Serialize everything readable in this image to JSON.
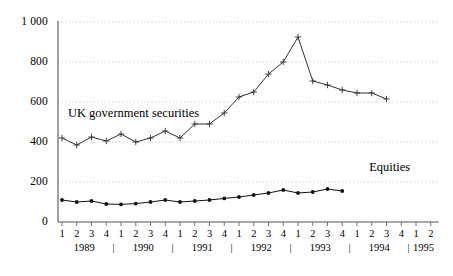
{
  "chart_data": {
    "type": "line",
    "title": "",
    "xlabel": "",
    "ylabel": "",
    "ylim": [
      0,
      1000
    ],
    "yticks": [
      0,
      200,
      400,
      600,
      800,
      1000
    ],
    "ytick_labels": [
      "0",
      "200",
      "400",
      "600",
      "800",
      "1 000"
    ],
    "grid": true,
    "grid_style": "dotted-horizontal",
    "legend": "inline-annotations",
    "x": [
      "1989 Q1",
      "1989 Q2",
      "1989 Q3",
      "1989 Q4",
      "1990 Q1",
      "1990 Q2",
      "1990 Q3",
      "1990 Q4",
      "1991 Q1",
      "1991 Q2",
      "1991 Q3",
      "1991 Q4",
      "1992 Q1",
      "1992 Q2",
      "1992 Q3",
      "1992 Q4",
      "1993 Q1",
      "1993 Q2",
      "1993 Q3",
      "1993 Q4",
      "1994 Q1",
      "1994 Q2",
      "1994 Q3",
      "1994 Q4",
      "1995 Q1",
      "1995 Q2"
    ],
    "quarter_labels": [
      "1",
      "2",
      "3",
      "4",
      "1",
      "2",
      "3",
      "4",
      "1",
      "2",
      "3",
      "4",
      "1",
      "2",
      "3",
      "4",
      "1",
      "2",
      "3",
      "4",
      "1",
      "2",
      "3",
      "4",
      "1",
      "2"
    ],
    "year_groups": [
      {
        "label": "1989",
        "start_index": 0,
        "count": 4
      },
      {
        "label": "1990",
        "start_index": 4,
        "count": 4
      },
      {
        "label": "1991",
        "start_index": 8,
        "count": 4
      },
      {
        "label": "1992",
        "start_index": 12,
        "count": 4
      },
      {
        "label": "1993",
        "start_index": 16,
        "count": 4
      },
      {
        "label": "1994",
        "start_index": 20,
        "count": 4
      },
      {
        "label": "1995",
        "start_index": 24,
        "count": 2
      }
    ],
    "year_separator": "|",
    "series": [
      {
        "name": "UK government securities",
        "marker": "plus",
        "color": "#333333",
        "label_x_pct": 15.0,
        "label_y_pct": 38.8,
        "values": [
          420,
          385,
          425,
          405,
          440,
          400,
          420,
          455,
          420,
          490,
          490,
          545,
          625,
          650,
          740,
          800,
          925,
          705,
          685,
          660,
          645,
          645,
          615,
          null,
          null,
          null
        ]
      },
      {
        "name": "Equities",
        "marker": "dot",
        "color": "#111111",
        "label_x_pct": 81.5,
        "label_y_pct": 58.5,
        "values": [
          110,
          100,
          105,
          90,
          88,
          92,
          100,
          110,
          100,
          105,
          110,
          118,
          125,
          135,
          145,
          160,
          145,
          150,
          165,
          155,
          null,
          null,
          null,
          null,
          null,
          null
        ]
      }
    ]
  }
}
